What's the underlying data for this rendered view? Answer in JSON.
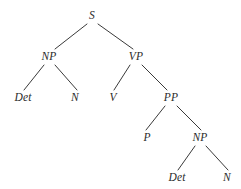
{
  "figure": {
    "name": "phrase-structure-tree",
    "width": 241,
    "height": 189,
    "background_color": "#ffffff",
    "line_color": "#3a3a3a",
    "line_width": 1,
    "text_color": "#2b2b2b"
  },
  "nodes": [
    {
      "id": "s",
      "label": "S",
      "x": 92,
      "y": 16
    },
    {
      "id": "np1",
      "label": "NP",
      "x": 49,
      "y": 57
    },
    {
      "id": "vp",
      "label": "VP",
      "x": 136,
      "y": 57
    },
    {
      "id": "det1",
      "label": "Det",
      "x": 23,
      "y": 98
    },
    {
      "id": "n1",
      "label": "N",
      "x": 75,
      "y": 98
    },
    {
      "id": "v",
      "label": "V",
      "x": 113,
      "y": 98
    },
    {
      "id": "pp",
      "label": "PP",
      "x": 171,
      "y": 98
    },
    {
      "id": "p",
      "label": "P",
      "x": 147,
      "y": 138
    },
    {
      "id": "np2",
      "label": "NP",
      "x": 200,
      "y": 138
    },
    {
      "id": "det2",
      "label": "Det",
      "x": 177,
      "y": 178
    },
    {
      "id": "n2",
      "label": "N",
      "x": 227,
      "y": 178
    }
  ],
  "edges": [
    {
      "id": "s-np1",
      "from": "S",
      "to": "NP",
      "x1": 87,
      "y1": 24,
      "x2": 55,
      "y2": 49
    },
    {
      "id": "s-vp",
      "from": "S",
      "to": "VP",
      "x1": 98,
      "y1": 24,
      "x2": 133,
      "y2": 49
    },
    {
      "id": "np1-det1",
      "from": "NP",
      "to": "Det",
      "x1": 44,
      "y1": 65,
      "x2": 24,
      "y2": 90
    },
    {
      "id": "np1-n1",
      "from": "NP",
      "to": "N",
      "x1": 55,
      "y1": 65,
      "x2": 77,
      "y2": 90
    },
    {
      "id": "vp-v",
      "from": "VP",
      "to": "V",
      "x1": 130,
      "y1": 65,
      "x2": 114,
      "y2": 90
    },
    {
      "id": "vp-pp",
      "from": "VP",
      "to": "PP",
      "x1": 142,
      "y1": 65,
      "x2": 167,
      "y2": 90
    },
    {
      "id": "pp-p",
      "from": "PP",
      "to": "P",
      "x1": 165,
      "y1": 106,
      "x2": 146,
      "y2": 130
    },
    {
      "id": "pp-np2",
      "from": "PP",
      "to": "NP",
      "x1": 177,
      "y1": 106,
      "x2": 201,
      "y2": 130
    },
    {
      "id": "np2-det2",
      "from": "NP",
      "to": "Det",
      "x1": 195,
      "y1": 146,
      "x2": 178,
      "y2": 170
    },
    {
      "id": "np2-n2",
      "from": "NP",
      "to": "N",
      "x1": 206,
      "y1": 146,
      "x2": 228,
      "y2": 170
    }
  ]
}
